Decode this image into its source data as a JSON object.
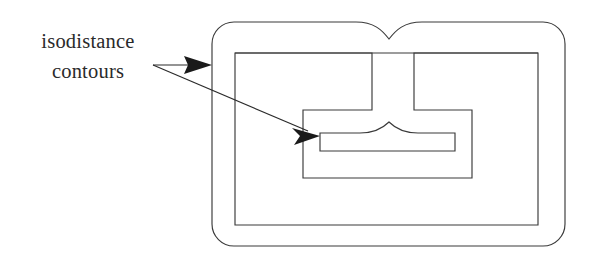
{
  "figure": {
    "background_color": "#ffffff",
    "stroke_color": "#3a3a3a",
    "arrow_color": "#1a1a1a",
    "text_color": "#2a2a2a"
  },
  "label": {
    "line1": "isodistance",
    "line2": "contours",
    "anchor_x": 88,
    "anchor_y": 48
  },
  "leaders": [
    {
      "name": "leader-to-outer-contour",
      "from_x": 153,
      "from_y": 65,
      "to_x": 212,
      "to_y": 65,
      "target": "outer-contour",
      "arrowhead": "solid-triangle"
    },
    {
      "name": "leader-to-inner-contour",
      "from_x": 153,
      "from_y": 65,
      "to_x": 320,
      "to_y": 136,
      "target": "inner-bar-contour",
      "arrowhead": "solid-triangle"
    }
  ],
  "contours": [
    {
      "name": "outer-contour",
      "label": "outermost isodistance contour",
      "shape": "rounded-rectangle-with-top-cusp",
      "left": 212,
      "top": 22,
      "right": 565,
      "bottom": 246,
      "corner_radius": 22,
      "cusp_x": 389,
      "cusp_y": 39
    },
    {
      "name": "middle-rectangle-contour",
      "label": "second isodistance contour",
      "shape": "rectangle",
      "left": 235,
      "top": 53,
      "right": 538,
      "bottom": 225
    },
    {
      "name": "middle-notched-contour",
      "label": "third isodistance contour with descending notch",
      "shape": "notched-polygon",
      "left": 235,
      "top": 53,
      "right": 538,
      "bottom": 225,
      "notch_left_x": 372,
      "notch_right_x": 414,
      "notch_bottom_y": 110,
      "arm_left_x": 303,
      "arm_right_x": 472,
      "arm_bottom_y": 178
    },
    {
      "name": "inner-bar-contour",
      "label": "innermost isodistance contour with upward cusp",
      "shape": "bar-with-cusp",
      "left": 320,
      "top": 133,
      "right": 455,
      "bottom": 151,
      "cusp_x": 389,
      "cusp_y": 122
    }
  ]
}
